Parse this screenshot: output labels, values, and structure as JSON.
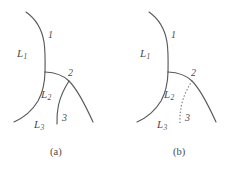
{
  "figure": {
    "background_color": "#ffffff",
    "stroke_color": "#595a5c",
    "dotted_stroke_color": "#7c7d80",
    "text_color": "#4a4b4d",
    "width": 246,
    "height": 172
  },
  "panels": [
    {
      "id": "a",
      "caption": "(a)",
      "branch_3_style": "solid",
      "region_labels": [
        {
          "name": "L1",
          "text": "L",
          "subscript": "1"
        },
        {
          "name": "L2",
          "text": "L",
          "subscript": "2"
        },
        {
          "name": "L3",
          "text": "L",
          "subscript": "3"
        }
      ],
      "segment_labels": [
        {
          "name": "segment-1",
          "text": "1"
        },
        {
          "name": "segment-2",
          "text": "2"
        },
        {
          "name": "segment-3",
          "text": "3"
        }
      ]
    },
    {
      "id": "b",
      "caption": "(b)",
      "branch_3_style": "dotted",
      "region_labels": [
        {
          "name": "L1",
          "text": "L",
          "subscript": "1"
        },
        {
          "name": "L2",
          "text": "L",
          "subscript": "2"
        },
        {
          "name": "L3",
          "text": "L",
          "subscript": "3"
        }
      ],
      "segment_labels": [
        {
          "name": "segment-1",
          "text": "1"
        },
        {
          "name": "segment-2",
          "text": "2"
        },
        {
          "name": "segment-3",
          "text": "3"
        }
      ]
    }
  ]
}
